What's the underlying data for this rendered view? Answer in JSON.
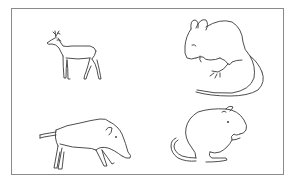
{
  "figure": {
    "border_color": "#8a8a8a",
    "line_color": "#3a3a3a",
    "background": "#ffffff"
  },
  "animals": [
    {
      "name": "deer",
      "position": "top-left"
    },
    {
      "name": "mouse",
      "position": "top-right"
    },
    {
      "name": "wild boar",
      "position": "bottom-left"
    },
    {
      "name": "hamster",
      "position": "bottom-right"
    }
  ]
}
